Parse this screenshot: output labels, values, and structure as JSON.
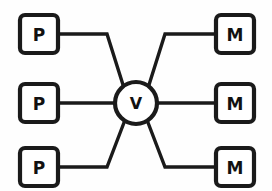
{
  "diagram": {
    "colors": {
      "background": "#fefefe",
      "stroke": "#1a1a1a",
      "node_fill": "#ffffff",
      "label": "#111111"
    },
    "nodes": [
      {
        "id": "p-top",
        "label": "P",
        "shape": "rounded-rect",
        "x": 20,
        "y": 15,
        "width": 38,
        "height": 38,
        "rx": 5
      },
      {
        "id": "p-middle",
        "label": "P",
        "shape": "rounded-rect",
        "x": 20,
        "y": 84,
        "width": 38,
        "height": 38,
        "rx": 5
      },
      {
        "id": "p-bottom",
        "label": "P",
        "shape": "rounded-rect",
        "x": 20,
        "y": 148,
        "width": 38,
        "height": 38,
        "rx": 5
      },
      {
        "id": "v-center",
        "label": "V",
        "shape": "circle",
        "cx": 136,
        "cy": 103,
        "r": 21
      },
      {
        "id": "m-top",
        "label": "M",
        "shape": "rounded-rect",
        "x": 216,
        "y": 15,
        "width": 38,
        "height": 38,
        "rx": 5
      },
      {
        "id": "m-middle",
        "label": "M",
        "shape": "rounded-rect",
        "x": 216,
        "y": 84,
        "width": 38,
        "height": 38,
        "rx": 5
      },
      {
        "id": "m-bottom",
        "label": "M",
        "shape": "rounded-rect",
        "x": 216,
        "y": 148,
        "width": 38,
        "height": 38,
        "rx": 5
      }
    ],
    "edges": [
      {
        "id": "edge-p-top-to-v",
        "from": "p-top",
        "to": "v-center",
        "points": "58,34 107,34 124,88"
      },
      {
        "id": "edge-p-middle-to-v",
        "from": "p-middle",
        "to": "v-center",
        "points": "58,103 115,103"
      },
      {
        "id": "edge-p-bottom-to-v",
        "from": "p-bottom",
        "to": "v-center",
        "points": "58,167 107,167 125,120"
      },
      {
        "id": "edge-v-to-m-top",
        "from": "v-center",
        "to": "m-top",
        "points": "148,88 165,34 216,34"
      },
      {
        "id": "edge-v-to-m-middle",
        "from": "v-center",
        "to": "m-middle",
        "points": "157,103 216,103"
      },
      {
        "id": "edge-v-to-m-bottom",
        "from": "v-center",
        "to": "m-bottom",
        "points": "147,120 165,167 216,167"
      }
    ]
  }
}
